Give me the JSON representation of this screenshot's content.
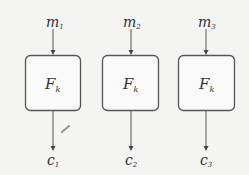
{
  "diagram": {
    "blocks": [
      {
        "input": "m",
        "input_sub": "1",
        "function": "F",
        "function_sub": "k",
        "output": "c",
        "output_sub": "1"
      },
      {
        "input": "m",
        "input_sub": "2",
        "function": "F",
        "function_sub": "k",
        "output": "c",
        "output_sub": "2"
      },
      {
        "input": "m",
        "input_sub": "3",
        "function": "F",
        "function_sub": "k",
        "output": "c",
        "output_sub": "3"
      }
    ]
  }
}
